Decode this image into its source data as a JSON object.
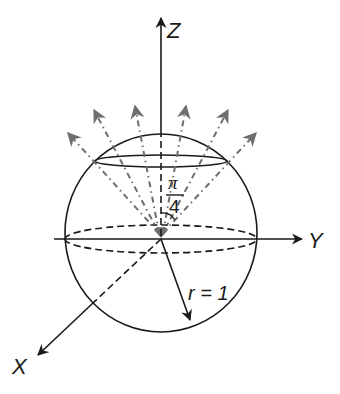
{
  "diagram": {
    "type": "3d-sphere-coordinate-diagram",
    "colors": {
      "stroke": "#1a1a1a",
      "ray": "#6e6e6e",
      "background": "#ffffff"
    },
    "axes": {
      "z": {
        "label": "Z"
      },
      "y": {
        "label": "Y"
      },
      "x": {
        "label": "X"
      }
    },
    "sphere": {
      "radius_label": "r = 1"
    },
    "angle": {
      "numerator": "π",
      "denominator": "4"
    },
    "rays": {
      "count": 6,
      "style": "dash-dot arrows"
    }
  }
}
